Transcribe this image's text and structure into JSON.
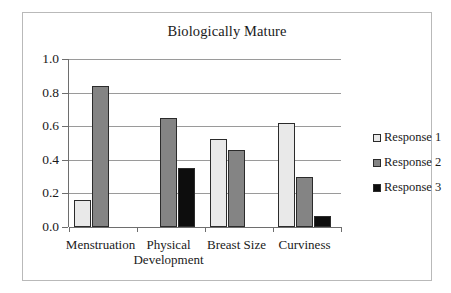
{
  "chart_data": {
    "type": "bar",
    "title": "Biologically Mature",
    "xlabel": "",
    "ylabel": "",
    "ylim": [
      0.0,
      1.0
    ],
    "ytick_labels": [
      "1.0",
      "0.8",
      "0.6",
      "0.4",
      "0.2",
      "0.0"
    ],
    "ytick_values": [
      1.0,
      0.8,
      0.6,
      0.4,
      0.2,
      0.0
    ],
    "grid": true,
    "legend_position": "right",
    "categories": [
      "Menstruation",
      "Physical Development",
      "Breast Size",
      "Curviness"
    ],
    "category_label_lines": [
      [
        "Menstruation"
      ],
      [
        "Physical",
        "Development"
      ],
      [
        "Breast Size"
      ],
      [
        "Curviness"
      ]
    ],
    "series": [
      {
        "name": "Response 1",
        "color": "#e9e9e9",
        "values": [
          0.16,
          0.0,
          0.525,
          0.62
        ]
      },
      {
        "name": "Response 2",
        "color": "#848484",
        "values": [
          0.84,
          0.65,
          0.46,
          0.3
        ]
      },
      {
        "name": "Response 3",
        "color": "#0d0d0d",
        "values": [
          0.0,
          0.35,
          0.005,
          0.065
        ]
      }
    ]
  },
  "legend": {
    "items": [
      {
        "label": "Response 1",
        "swatch": "s1"
      },
      {
        "label": "Response 2",
        "swatch": "s2"
      },
      {
        "label": "Response 3",
        "swatch": "s3"
      }
    ]
  }
}
